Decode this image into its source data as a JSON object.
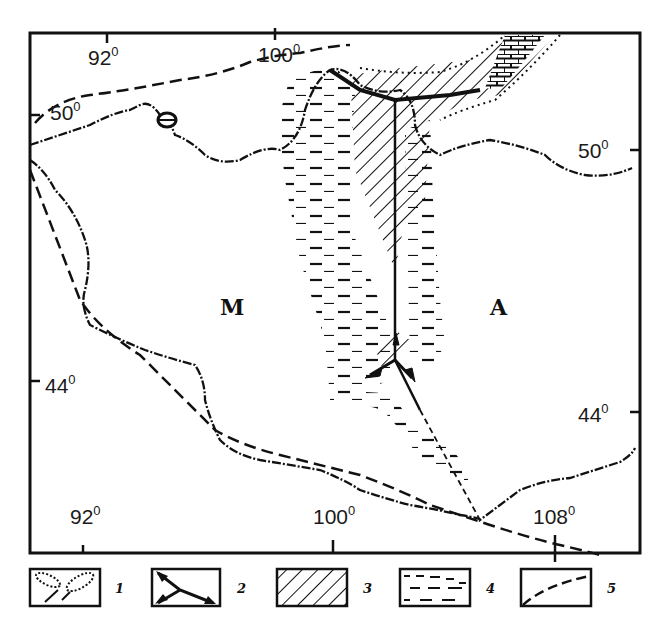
{
  "figure": {
    "type": "geological-tectonic map",
    "region_labels": [
      {
        "id": "M",
        "text": "M"
      },
      {
        "id": "A",
        "text": "A"
      }
    ],
    "longitude_labels": {
      "top": [
        {
          "value": "92",
          "suffix": "0"
        },
        {
          "value": "100",
          "suffix": "0"
        }
      ],
      "bottom": [
        {
          "value": "92",
          "suffix": "0"
        },
        {
          "value": "100",
          "suffix": "0"
        },
        {
          "value": "108",
          "suffix": "0"
        }
      ]
    },
    "latitude_labels": {
      "left": [
        {
          "value": "50",
          "suffix": "0"
        },
        {
          "value": "44",
          "suffix": "0"
        }
      ],
      "right": [
        {
          "value": "50",
          "suffix": "0"
        },
        {
          "value": "44",
          "suffix": "0"
        }
      ]
    },
    "colors": {
      "ink": "#111111",
      "paper": "#ffffff"
    }
  },
  "legend": {
    "items": [
      {
        "number": "1",
        "symbol": "dotted-lenses"
      },
      {
        "number": "2",
        "symbol": "triple-junction-arrows"
      },
      {
        "number": "3",
        "symbol": "diagonal-hatch"
      },
      {
        "number": "4",
        "symbol": "dashed-fill"
      },
      {
        "number": "5",
        "symbol": "dashed-line"
      }
    ]
  }
}
